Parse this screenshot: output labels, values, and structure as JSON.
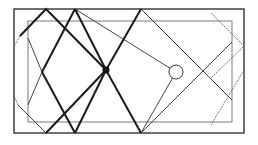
{
  "diagram": {
    "type": "billiard-reflection-paths",
    "width": 258,
    "height": 145,
    "colors": {
      "background": "#ffffff",
      "outer_frame": "#333333",
      "inner_frame": "#7a7a7a",
      "thick_path": "#1a1a1a",
      "thin_path": "#444444",
      "dashed_path": "#666666",
      "source_point": "#111111",
      "target_circle": "#333333"
    },
    "outer_rect": {
      "x": 14,
      "y": 9,
      "w": 230,
      "h": 124
    },
    "inner_rect": {
      "x": 28,
      "y": 21,
      "w": 204,
      "h": 101
    },
    "source_point": {
      "cx": 106,
      "cy": 70,
      "r": 3.5
    },
    "target_circle": {
      "cx": 176,
      "cy": 72,
      "r": 7
    },
    "thick_paths": [
      {
        "points": [
          [
            106,
            70
          ],
          [
            46,
            9
          ],
          [
            20,
            36
          ]
        ]
      },
      {
        "points": [
          [
            106,
            70
          ],
          [
            75,
            9
          ]
        ]
      },
      {
        "points": [
          [
            106,
            70
          ],
          [
            46,
            133
          ]
        ]
      },
      {
        "points": [
          [
            106,
            70
          ],
          [
            75,
            133
          ]
        ]
      },
      {
        "points": [
          [
            106,
            70
          ],
          [
            141,
            9
          ]
        ]
      },
      {
        "points": [
          [
            106,
            70
          ],
          [
            141,
            133
          ]
        ]
      },
      {
        "points": [
          [
            75,
            9
          ],
          [
            42,
            72
          ]
        ]
      },
      {
        "points": [
          [
            75,
            133
          ],
          [
            42,
            72
          ]
        ]
      }
    ],
    "thin_paths": [
      {
        "points": [
          [
            141,
            9
          ],
          [
            232,
            100
          ]
        ]
      },
      {
        "points": [
          [
            141,
            133
          ],
          [
            232,
            42
          ]
        ]
      },
      {
        "points": [
          [
            46,
            9
          ],
          [
            20,
            36
          ]
        ]
      },
      {
        "points": [
          [
            46,
            133
          ],
          [
            18,
            105
          ]
        ]
      },
      {
        "points": [
          [
            75,
            9
          ],
          [
            176,
            72
          ]
        ]
      },
      {
        "points": [
          [
            141,
            133
          ],
          [
            176,
            72
          ]
        ]
      },
      {
        "points": [
          [
            28,
            38
          ],
          [
            42,
            72
          ],
          [
            28,
            105
          ]
        ]
      }
    ],
    "dashed_paths": [
      {
        "points": [
          [
            211,
            13
          ],
          [
            244,
            46
          ],
          [
            211,
            78
          ]
        ]
      },
      {
        "points": [
          [
            244,
            70
          ],
          [
            211,
            125
          ]
        ]
      },
      {
        "points": [
          [
            20,
            36
          ],
          [
            14,
            46
          ]
        ]
      },
      {
        "points": [
          [
            18,
            105
          ],
          [
            14,
            96
          ]
        ]
      }
    ]
  }
}
